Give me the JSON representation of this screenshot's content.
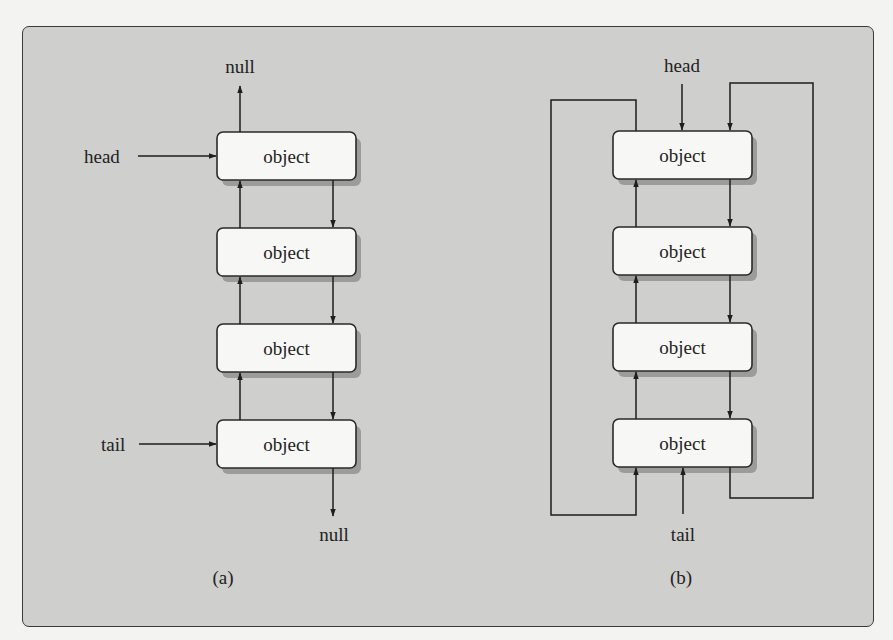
{
  "figure": {
    "panel_background": "#cfcfcd",
    "node_fill": "#f7f7f5",
    "stroke_color": "#1e1e1e"
  },
  "diagram_a": {
    "caption": "(a)",
    "head_label": "head",
    "tail_label": "tail",
    "null_top_label": "null",
    "null_bottom_label": "null",
    "nodes": [
      {
        "label": "object"
      },
      {
        "label": "object"
      },
      {
        "label": "object"
      },
      {
        "label": "object"
      }
    ]
  },
  "diagram_b": {
    "caption": "(b)",
    "head_label": "head",
    "tail_label": "tail",
    "nodes": [
      {
        "label": "object"
      },
      {
        "label": "object"
      },
      {
        "label": "object"
      },
      {
        "label": "object"
      }
    ]
  }
}
